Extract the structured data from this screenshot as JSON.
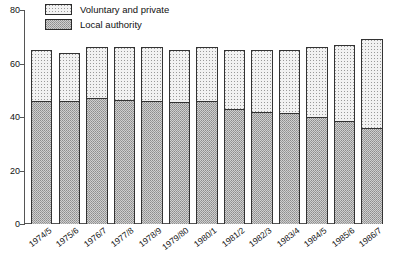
{
  "chart_data": {
    "type": "bar",
    "stacked": true,
    "title": "",
    "subtitle": "",
    "xlabel": "",
    "ylabel": "",
    "ylim": [
      0,
      80
    ],
    "yticks": [
      0,
      20,
      40,
      60,
      80
    ],
    "grid": false,
    "legend_position": "top-left",
    "categories": [
      "1974/5",
      "1975/6",
      "1976/7",
      "1977/8",
      "1978/9",
      "1979/80",
      "1980/1",
      "1981/2",
      "1982/3",
      "1983/4",
      "1984/5",
      "1985/6",
      "1986/7"
    ],
    "series": [
      {
        "name": "Voluntary and private",
        "fill": "light-dotted",
        "color": "#f2f2f2",
        "values": [
          19,
          18,
          19,
          19.5,
          20,
          19.5,
          20,
          22,
          23,
          23.5,
          26,
          28.5,
          33
        ]
      },
      {
        "name": "Local authority",
        "fill": "grey-stipple",
        "color": "#cfcfcf",
        "values": [
          46,
          46,
          47,
          46.5,
          46,
          45.5,
          46,
          43,
          42,
          41.5,
          40,
          38.5,
          36
        ]
      }
    ],
    "totals": [
      65,
      64,
      66,
      66,
      66,
      65,
      66,
      65,
      65,
      65,
      66,
      67,
      69
    ]
  },
  "legend": {
    "items": [
      {
        "label": "Voluntary and private",
        "swatch": "voluntary-swatch"
      },
      {
        "label": "Local authority",
        "swatch": "local-authority-swatch"
      }
    ]
  },
  "axes": {
    "y_tick_labels": [
      "80",
      "60",
      "40",
      "20",
      "0"
    ],
    "x_tick_labels": [
      "1974/5",
      "1975/6",
      "1976/7",
      "1977/8",
      "1978/9",
      "1979/80",
      "1980/1",
      "1981/2",
      "1982/3",
      "1983/4",
      "1984/5",
      "1985/6",
      "1986/7"
    ]
  },
  "colors": {
    "axis": "#555555",
    "bar_outline": "#333333",
    "voluntary_fill": "#f2f2f2",
    "local_authority_fill": "#cfcfcf",
    "text": "#111111",
    "background": "#ffffff"
  }
}
